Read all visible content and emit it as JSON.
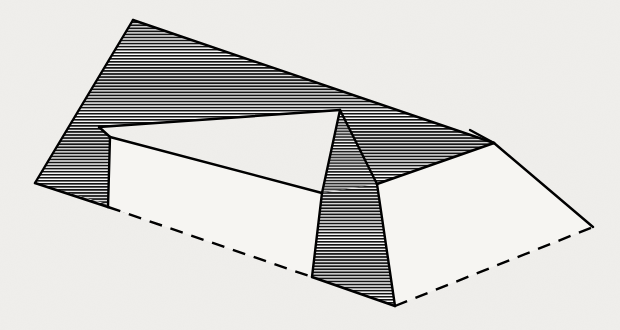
{
  "figure": {
    "title": "Hatched prismatic solid with hip and valley faces",
    "caption": "",
    "background_color": "#f2f1ee",
    "paper_tint_color": "#eeedea",
    "ink_color": "#000000",
    "hatch_line_color": "#1a1a1a",
    "hatch_fill_base_color": "#b9b9b9",
    "white_face_color": "#f7f6f3",
    "canvas": {
      "width": 620,
      "height": 330
    }
  },
  "geometry": {
    "vertices": {
      "top_ridge_left_corner": [
        133,
        20
      ],
      "left_eave_point": [
        35,
        183
      ],
      "notch_inner_left": [
        100,
        127
      ],
      "notch_corner_left": [
        110,
        137
      ],
      "notch_skirt_bottom_left": [
        108,
        207
      ],
      "notch_skirt_bottom_right": [
        125,
        212
      ],
      "ridge_apex_inner": [
        340,
        110
      ],
      "valley_left_foot": [
        322,
        193
      ],
      "valley_right_foot": [
        377,
        184
      ],
      "front_face_bottom_left": [
        312,
        277
      ],
      "front_face_bottom_right": [
        395,
        306
      ],
      "right_hip_top": [
        494,
        143
      ],
      "right_far_point": [
        593,
        227
      ],
      "top_ridge_right_corner": [
        470,
        130
      ]
    },
    "faces": [
      {
        "name": "large-back-hatched-face",
        "style": "hatched",
        "points": "133,20 494,143 377,184 340,110 100,127 110,137 110,205 35,183"
      },
      {
        "name": "left-skirt-hatched-face",
        "style": "hatched",
        "points": "35,183 110,205 125,212 108,207"
      },
      {
        "name": "inner-valley-triangle",
        "style": "hatched",
        "points": "340,110 377,184 322,193"
      },
      {
        "name": "front-right-hatched-face",
        "style": "hatched",
        "points": "322,193 377,184 395,306 312,277"
      },
      {
        "name": "right-white-hip-face",
        "style": "white",
        "points": "494,143 593,227 395,306 377,184"
      },
      {
        "name": "left-white-inner-face",
        "style": "white",
        "points": "110,137 322,193 312,277 108,207"
      }
    ],
    "solid_edges": [
      {
        "name": "edge-top-ridge",
        "from": [
          133,
          20
        ],
        "to": [
          494,
          143
        ]
      },
      {
        "name": "edge-left-slope",
        "from": [
          133,
          20
        ],
        "to": [
          35,
          183
        ]
      },
      {
        "name": "edge-left-eave-skirt",
        "from": [
          35,
          183
        ],
        "to": [
          108,
          207
        ]
      },
      {
        "name": "edge-notch-left-vertical",
        "from": [
          110,
          137
        ],
        "to": [
          108,
          207
        ]
      },
      {
        "name": "edge-valley-left",
        "from": [
          100,
          127
        ],
        "to": [
          340,
          110
        ]
      },
      {
        "name": "edge-valley-lower-left",
        "from": [
          110,
          137
        ],
        "to": [
          322,
          193
        ]
      },
      {
        "name": "edge-hip-apex-left",
        "from": [
          340,
          110
        ],
        "to": [
          322,
          193
        ]
      },
      {
        "name": "edge-hip-apex-right",
        "from": [
          340,
          110
        ],
        "to": [
          377,
          184
        ]
      },
      {
        "name": "edge-front-left-vertical",
        "from": [
          322,
          193
        ],
        "to": [
          312,
          277
        ]
      },
      {
        "name": "edge-front-bottom",
        "from": [
          312,
          277
        ],
        "to": [
          395,
          306
        ]
      },
      {
        "name": "edge-front-right-slope",
        "from": [
          377,
          184
        ],
        "to": [
          395,
          306
        ]
      },
      {
        "name": "edge-right-hip-upper",
        "from": [
          494,
          143
        ],
        "to": [
          593,
          227
        ]
      },
      {
        "name": "edge-right-hip-inner",
        "from": [
          377,
          184
        ],
        "to": [
          494,
          143
        ]
      }
    ],
    "hidden_edges": [
      {
        "name": "hidden-base-front-left",
        "from": [
          108,
          207
        ],
        "to": [
          312,
          277
        ]
      },
      {
        "name": "hidden-base-front-right",
        "from": [
          395,
          306
        ],
        "to": [
          593,
          227
        ]
      }
    ]
  },
  "labels": {
    "annotations": []
  }
}
